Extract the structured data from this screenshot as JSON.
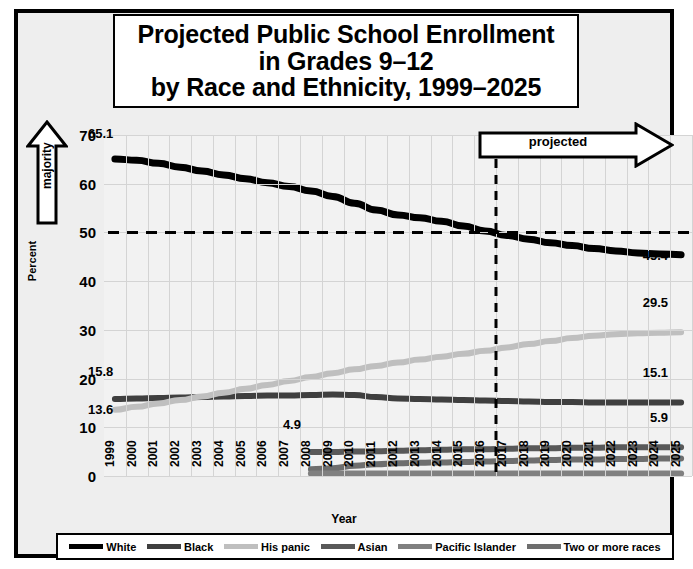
{
  "title": {
    "line1": "Projected Public School Enrollment",
    "line2": "in Grades 9–12",
    "line3": "by Race and Ethnicity, 1999–2025"
  },
  "annotations": {
    "majority": "majority",
    "projected": "projected"
  },
  "data_labels": {
    "white_start": "65.1",
    "white_end": "45.4",
    "black_start": "15.8",
    "black_end": "15.1",
    "hispanic_start": "13.6",
    "hispanic_end": "29.5",
    "asian_start": "4.9",
    "asian_end": "5.9"
  },
  "legend": [
    {
      "label": "White",
      "color": "#000000"
    },
    {
      "label": "Black",
      "color": "#3f3f3f"
    },
    {
      "label": "His panic",
      "color": "#bfbfbf"
    },
    {
      "label": "Asian",
      "color": "#595959"
    },
    {
      "label": "Pacific Islander",
      "color": "#808080"
    },
    {
      "label": "Two or more races",
      "color": "#6e6e6e"
    }
  ],
  "chart_data": {
    "type": "line",
    "title": "Projected Public School Enrollment in Grades 9–12 by Race and Ethnicity, 1999–2025",
    "xlabel": "Year",
    "ylabel": "Percent",
    "ylim": [
      0,
      70
    ],
    "yticks": [
      0,
      10,
      20,
      30,
      40,
      50,
      60,
      70
    ],
    "grid": true,
    "legend_position": "bottom",
    "categories": [
      1999,
      2000,
      2001,
      2002,
      2003,
      2004,
      2005,
      2006,
      2007,
      2008,
      2009,
      2010,
      2011,
      2012,
      2013,
      2014,
      2015,
      2016,
      2017,
      2018,
      2019,
      2020,
      2021,
      2022,
      2023,
      2024,
      2025
    ],
    "projection_start_year": 2016.5,
    "reference_line_y": 50,
    "series": [
      {
        "name": "White",
        "color": "#000000",
        "x": [
          1999,
          2000,
          2001,
          2002,
          2003,
          2004,
          2005,
          2006,
          2007,
          2008,
          2009,
          2010,
          2011,
          2012,
          2013,
          2014,
          2015,
          2016,
          2017,
          2018,
          2019,
          2020,
          2021,
          2022,
          2023,
          2024,
          2025
        ],
        "values": [
          65.1,
          64.8,
          64.2,
          63.4,
          62.6,
          61.8,
          61.0,
          60.2,
          59.4,
          58.5,
          57.4,
          56.0,
          54.6,
          53.6,
          53.0,
          52.3,
          51.3,
          50.3,
          49.4,
          48.6,
          47.9,
          47.3,
          46.7,
          46.2,
          45.8,
          45.6,
          45.4
        ]
      },
      {
        "name": "Black",
        "color": "#3f3f3f",
        "x": [
          1999,
          2000,
          2001,
          2002,
          2003,
          2004,
          2005,
          2006,
          2007,
          2008,
          2009,
          2010,
          2011,
          2012,
          2013,
          2014,
          2015,
          2016,
          2017,
          2018,
          2019,
          2020,
          2021,
          2022,
          2023,
          2024,
          2025
        ],
        "values": [
          15.8,
          15.9,
          16.0,
          16.1,
          16.2,
          16.3,
          16.4,
          16.5,
          16.5,
          16.6,
          16.7,
          16.6,
          16.2,
          15.9,
          15.8,
          15.7,
          15.6,
          15.5,
          15.4,
          15.3,
          15.2,
          15.2,
          15.1,
          15.1,
          15.1,
          15.1,
          15.1
        ]
      },
      {
        "name": "His panic",
        "color": "#bfbfbf",
        "x": [
          1999,
          2000,
          2001,
          2002,
          2003,
          2004,
          2005,
          2006,
          2007,
          2008,
          2009,
          2010,
          2011,
          2012,
          2013,
          2014,
          2015,
          2016,
          2017,
          2018,
          2019,
          2020,
          2021,
          2022,
          2023,
          2024,
          2025
        ],
        "values": [
          13.6,
          14.2,
          14.9,
          15.6,
          16.3,
          17.1,
          17.9,
          18.7,
          19.5,
          20.3,
          21.1,
          21.9,
          22.6,
          23.3,
          23.9,
          24.5,
          25.1,
          25.7,
          26.4,
          27.1,
          27.7,
          28.3,
          28.8,
          29.1,
          29.3,
          29.4,
          29.5
        ]
      },
      {
        "name": "Asian",
        "color": "#595959",
        "x": [
          2008,
          2009,
          2010,
          2011,
          2012,
          2013,
          2014,
          2015,
          2016,
          2017,
          2018,
          2019,
          2020,
          2021,
          2022,
          2023,
          2024,
          2025
        ],
        "values": [
          4.9,
          4.9,
          5.0,
          5.1,
          5.2,
          5.3,
          5.4,
          5.5,
          5.5,
          5.6,
          5.7,
          5.7,
          5.8,
          5.8,
          5.9,
          5.9,
          5.9,
          5.9
        ]
      },
      {
        "name": "Two or more races",
        "color": "#6e6e6e",
        "x": [
          2008,
          2009,
          2010,
          2011,
          2012,
          2013,
          2014,
          2015,
          2016,
          2017,
          2018,
          2019,
          2020,
          2021,
          2022,
          2023,
          2024,
          2025
        ],
        "values": [
          1.4,
          1.6,
          2.1,
          2.4,
          2.6,
          2.7,
          2.8,
          2.9,
          3.0,
          3.1,
          3.2,
          3.3,
          3.4,
          3.4,
          3.5,
          3.5,
          3.6,
          3.6
        ]
      },
      {
        "name": "Pacific Islander",
        "color": "#808080",
        "x": [
          2008,
          2009,
          2010,
          2011,
          2012,
          2013,
          2014,
          2015,
          2016,
          2017,
          2018,
          2019,
          2020,
          2021,
          2022,
          2023,
          2024,
          2025
        ],
        "values": [
          0.5,
          0.5,
          0.5,
          0.5,
          0.5,
          0.5,
          0.5,
          0.5,
          0.5,
          0.5,
          0.5,
          0.5,
          0.5,
          0.5,
          0.5,
          0.5,
          0.5,
          0.5
        ]
      }
    ]
  }
}
